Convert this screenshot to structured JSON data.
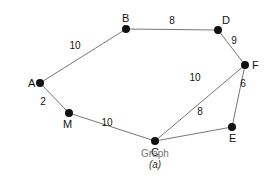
{
  "graph": {
    "caption": "Graph",
    "subcaption": "(a)",
    "edge_color": "#666666",
    "node_color": "#111111",
    "nodes": [
      {
        "id": "A",
        "label": "A",
        "x": 40,
        "y": 83,
        "lx": 28,
        "ly": 87
      },
      {
        "id": "B",
        "label": "B",
        "x": 126,
        "y": 29,
        "lx": 122,
        "ly": 22
      },
      {
        "id": "D",
        "label": "D",
        "x": 218,
        "y": 30,
        "lx": 222,
        "ly": 24
      },
      {
        "id": "F",
        "label": "F",
        "x": 245,
        "y": 65,
        "lx": 252,
        "ly": 69
      },
      {
        "id": "E",
        "label": "E",
        "x": 232,
        "y": 127,
        "lx": 229,
        "ly": 142
      },
      {
        "id": "C",
        "label": "C",
        "x": 155,
        "y": 141,
        "lx": 151,
        "ly": 156
      },
      {
        "id": "M",
        "label": "M",
        "x": 69,
        "y": 113,
        "lx": 63,
        "ly": 128
      }
    ],
    "edges": [
      {
        "from": "A",
        "to": "B",
        "weight": "10",
        "wx": 75,
        "wy": 49
      },
      {
        "from": "B",
        "to": "D",
        "weight": "8",
        "wx": 172,
        "wy": 24
      },
      {
        "from": "D",
        "to": "F",
        "weight": "9",
        "wx": 234,
        "wy": 44
      },
      {
        "from": "F",
        "to": "C",
        "weight": "10",
        "wx": 195,
        "wy": 81
      },
      {
        "from": "F",
        "to": "E",
        "weight": "6",
        "wx": 243,
        "wy": 87
      },
      {
        "from": "C",
        "to": "E",
        "weight": "8",
        "wx": 200,
        "wy": 115
      },
      {
        "from": "A",
        "to": "M",
        "weight": "2",
        "wx": 43,
        "wy": 105
      },
      {
        "from": "M",
        "to": "C",
        "weight": "10",
        "wx": 107,
        "wy": 126
      }
    ]
  }
}
